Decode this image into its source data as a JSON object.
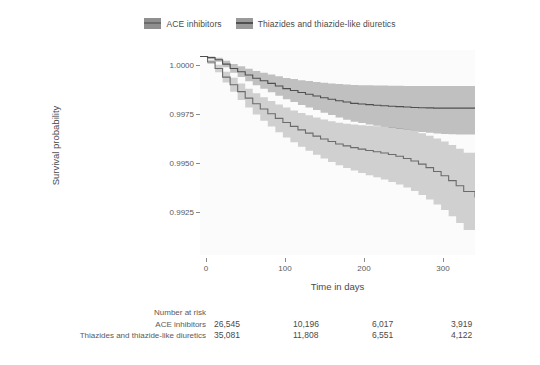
{
  "legend": {
    "position": "top-center",
    "entries": [
      {
        "label": "ACE inhibitors",
        "color": "#8f8f8f",
        "line_color": "#6b6b6b"
      },
      {
        "label": "Thiazides and thiazide-like diuretics",
        "color": "#9a9a9a",
        "line_color": "#4f4f4f"
      }
    ]
  },
  "axes": {
    "ylabel": "Survival probability",
    "xlabel": "Time in days",
    "yticks": [
      "1.0000",
      "0.9975",
      "0.9950",
      "0.9925"
    ],
    "ytick_values": [
      1.0,
      0.9975,
      0.995,
      0.9925
    ],
    "xticks": [
      "0",
      "100",
      "200",
      "300"
    ],
    "xtick_values": [
      0,
      100,
      200,
      300
    ]
  },
  "risk_table": {
    "title": "Number at risk",
    "rows": [
      {
        "label": "ACE inhibitors",
        "values": [
          "26,545",
          "10,196",
          "6,017",
          "3,919"
        ]
      },
      {
        "label": "Thiazides and thiazide-like diuretics",
        "values": [
          "35,081",
          "11,808",
          "6,551",
          "4,122"
        ]
      }
    ]
  },
  "chart_data": {
    "type": "line",
    "title": "",
    "xlabel": "Time in days",
    "ylabel": "Survival probability",
    "xlim": [
      0,
      365
    ],
    "ylim": [
      0.99085,
      1.0003
    ],
    "grid": false,
    "legend_position": "top-center",
    "style": "kaplan-meier-step-with-confidence-band",
    "series": [
      {
        "name": "Thiazides and thiazide-like diuretics",
        "line_color": "#4f4f4f",
        "band_color": "#9a9a9a",
        "x": [
          0,
          10,
          20,
          30,
          40,
          50,
          60,
          70,
          80,
          90,
          100,
          110,
          120,
          130,
          140,
          150,
          160,
          170,
          180,
          190,
          200,
          210,
          220,
          230,
          240,
          250,
          260,
          270,
          280,
          290,
          300,
          310,
          320,
          330,
          340,
          350,
          365
        ],
        "y": [
          1.0,
          0.99995,
          0.99985,
          0.99965,
          0.99945,
          0.9993,
          0.99915,
          0.999,
          0.99888,
          0.99876,
          0.99864,
          0.99852,
          0.99843,
          0.99834,
          0.99826,
          0.99818,
          0.9981,
          0.99803,
          0.99796,
          0.9979,
          0.99784,
          0.99781,
          0.99778,
          0.99775,
          0.99773,
          0.99771,
          0.99769,
          0.99767,
          0.99765,
          0.99764,
          0.99763,
          0.99762,
          0.99762,
          0.99762,
          0.99762,
          0.99762,
          0.99762
        ],
        "ci_lower": [
          1.0,
          0.9999,
          0.99976,
          0.9995,
          0.99925,
          0.99905,
          0.99886,
          0.99867,
          0.99851,
          0.99835,
          0.99819,
          0.99803,
          0.9979,
          0.99777,
          0.99765,
          0.99753,
          0.99741,
          0.9973,
          0.99719,
          0.99709,
          0.99699,
          0.99693,
          0.99687,
          0.99681,
          0.99676,
          0.99671,
          0.99666,
          0.99661,
          0.99656,
          0.99652,
          0.99648,
          0.99645,
          0.99643,
          0.99642,
          0.99641,
          0.9964,
          0.9964
        ],
        "ci_upper": [
          1.0,
          1.0,
          0.99994,
          0.9998,
          0.99965,
          0.99955,
          0.99944,
          0.99933,
          0.99925,
          0.99917,
          0.99909,
          0.99901,
          0.99896,
          0.99891,
          0.99887,
          0.99883,
          0.99879,
          0.99876,
          0.99873,
          0.99871,
          0.99869,
          0.99868,
          0.99867,
          0.99866,
          0.99866,
          0.99865,
          0.99865,
          0.99864,
          0.99864,
          0.99864,
          0.99864,
          0.99864,
          0.99864,
          0.99864,
          0.99864,
          0.99864,
          0.99864
        ]
      },
      {
        "name": "ACE inhibitors",
        "line_color": "#6b6b6b",
        "band_color": "#b4b4b4",
        "x": [
          0,
          10,
          20,
          30,
          40,
          50,
          60,
          70,
          80,
          90,
          100,
          110,
          120,
          130,
          140,
          150,
          160,
          170,
          180,
          190,
          200,
          210,
          220,
          230,
          240,
          250,
          260,
          270,
          280,
          290,
          300,
          310,
          320,
          330,
          340,
          350,
          365
        ],
        "y": [
          1.0,
          0.99975,
          0.99945,
          0.99905,
          0.9987,
          0.99838,
          0.99808,
          0.99782,
          0.99758,
          0.99736,
          0.99715,
          0.99696,
          0.99678,
          0.99662,
          0.99647,
          0.99633,
          0.9962,
          0.99608,
          0.99597,
          0.99588,
          0.9958,
          0.99573,
          0.99567,
          0.99561,
          0.99555,
          0.99548,
          0.9954,
          0.9953,
          0.99518,
          0.99504,
          0.99488,
          0.9947,
          0.9945,
          0.99428,
          0.99404,
          0.99378,
          0.9935
        ],
        "ci_lower": [
          1.0,
          0.99965,
          0.99928,
          0.9988,
          0.99838,
          0.998,
          0.99765,
          0.99733,
          0.99704,
          0.99677,
          0.99651,
          0.99627,
          0.99605,
          0.99584,
          0.99565,
          0.99547,
          0.9953,
          0.99514,
          0.99499,
          0.99486,
          0.99474,
          0.99463,
          0.99453,
          0.99443,
          0.99433,
          0.99422,
          0.9941,
          0.99396,
          0.9938,
          0.99362,
          0.99341,
          0.99318,
          0.99292,
          0.99264,
          0.99233,
          0.992,
          0.99165
        ],
        "ci_upper": [
          1.0,
          0.99985,
          0.99962,
          0.9993,
          0.99902,
          0.99876,
          0.99851,
          0.99831,
          0.99812,
          0.99795,
          0.99779,
          0.99765,
          0.99751,
          0.9974,
          0.99729,
          0.99719,
          0.9971,
          0.99702,
          0.99695,
          0.9969,
          0.99686,
          0.99683,
          0.99681,
          0.99679,
          0.99677,
          0.99674,
          0.9967,
          0.99664,
          0.99656,
          0.99646,
          0.99635,
          0.99622,
          0.99608,
          0.99592,
          0.99575,
          0.99556,
          0.99535
        ]
      }
    ]
  }
}
